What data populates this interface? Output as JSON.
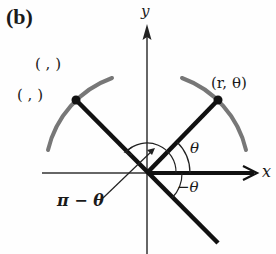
{
  "panel_label": "(b)",
  "axes": {
    "x_label": "x",
    "y_label": "y"
  },
  "points": {
    "right": {
      "label": "(r, θ)"
    },
    "left_upper": {
      "label": "(  ,  )"
    },
    "left_lower": {
      "label": "(  ,  )"
    }
  },
  "angles": {
    "theta": "θ",
    "neg_theta": "−θ",
    "pi_minus_theta": "π − θ"
  },
  "colors": {
    "line": "#111111",
    "arc": "#777777",
    "axis": "#333333"
  }
}
